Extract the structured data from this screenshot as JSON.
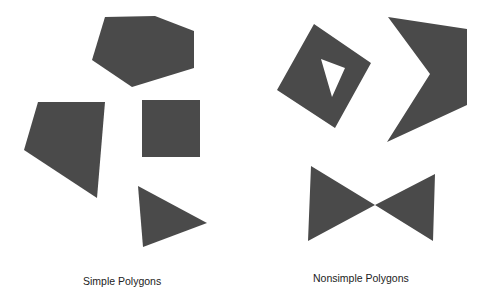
{
  "groups": {
    "simple": {
      "label": "Simple Polygons",
      "shapes": [
        {
          "name": "pentagon",
          "points": "105,17 155,16 194,31 194,68 132,87 92,60"
        },
        {
          "name": "quadrilateral",
          "points": "38,102 105,102 97,198 24,150"
        },
        {
          "name": "square",
          "points": "142,100 200,100 200,157 142,157"
        },
        {
          "name": "triangle",
          "points": "138,186 207,223 143,247"
        }
      ]
    },
    "nonsimple": {
      "label": "Nonsimple Polygons",
      "shapes": [
        {
          "name": "diamond-with-hole",
          "outer": "314,24 371,63 335,128 277,90",
          "hole": "321,59 345,68 332,97"
        },
        {
          "name": "chevron",
          "points": "388,17 467,29 467,105 387,142 430,74"
        },
        {
          "name": "bowtie",
          "points": "311,166 375,205 435,174 433,241 375,205 308,241"
        }
      ]
    }
  },
  "colors": {
    "fill": "#4a4a4a",
    "background": "#ffffff",
    "text": "#222222"
  }
}
